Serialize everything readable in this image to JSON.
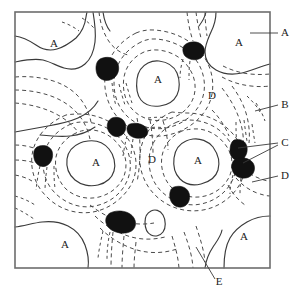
{
  "figure": {
    "kind": "contour-microstructure-diagram",
    "width": 296,
    "height": 294,
    "background_color": "#ffffff",
    "frame": {
      "x": 15,
      "y": 12,
      "width": 255,
      "height": 256,
      "stroke_color": "#6d6d6d"
    },
    "colors": {
      "solid_contour": "#3a3a3a",
      "dashed_contour": "#4a4a4a",
      "grain_fill": "#111111",
      "leader": "#3a3a3a",
      "label_text": "#222222"
    }
  },
  "interior_labels": [
    {
      "id": "a-top-left",
      "text": "A",
      "x": 54,
      "y": 47
    },
    {
      "id": "a-top-center",
      "text": "A",
      "x": 158,
      "y": 83
    },
    {
      "id": "a-top-right",
      "text": "A",
      "x": 239,
      "y": 46
    },
    {
      "id": "d-upper-right",
      "text": "D",
      "x": 212,
      "y": 99
    },
    {
      "id": "a-mid-left",
      "text": "A",
      "x": 96,
      "y": 166
    },
    {
      "id": "d-center",
      "text": "D",
      "x": 152,
      "y": 163
    },
    {
      "id": "a-mid-right",
      "text": "A",
      "x": 198,
      "y": 164
    },
    {
      "id": "a-bottom-left",
      "text": "A",
      "x": 65,
      "y": 248
    },
    {
      "id": "a-bottom-right",
      "text": "A",
      "x": 244,
      "y": 240
    }
  ],
  "callout_labels": [
    {
      "id": "callout-a",
      "text": "A",
      "x": 285,
      "y": 36
    },
    {
      "id": "callout-b",
      "text": "B",
      "x": 285,
      "y": 108
    },
    {
      "id": "callout-c",
      "text": "C",
      "x": 285,
      "y": 146
    },
    {
      "id": "callout-d",
      "text": "D",
      "x": 285,
      "y": 179
    },
    {
      "id": "callout-e",
      "text": "E",
      "x": 219,
      "y": 285
    }
  ],
  "leader_lines": [
    {
      "id": "leader-a",
      "points": "250,33 278,33"
    },
    {
      "id": "leader-b",
      "points": "255,111 278,105"
    },
    {
      "id": "leader-c-upper",
      "points": "238,148 278,143"
    },
    {
      "id": "leader-c-lower",
      "points": "243,163 278,145"
    },
    {
      "id": "leader-d",
      "points": "252,182 278,176"
    },
    {
      "id": "leader-e",
      "points": "196,247 215,279"
    }
  ],
  "grains": [
    {
      "id": "grain-top-center-right",
      "cx": 194,
      "cy": 50
    },
    {
      "id": "grain-upper-left",
      "cx": 106,
      "cy": 70
    },
    {
      "id": "grain-center-upper-a",
      "cx": 117,
      "cy": 126
    },
    {
      "id": "grain-center-upper-b",
      "cx": 138,
      "cy": 130
    },
    {
      "id": "grain-left-mid",
      "cx": 43,
      "cy": 155
    },
    {
      "id": "grain-right-upper",
      "cx": 240,
      "cy": 150
    },
    {
      "id": "grain-right-lower",
      "cx": 245,
      "cy": 165
    },
    {
      "id": "grain-center-lower",
      "cx": 180,
      "cy": 196
    },
    {
      "id": "grain-bottom-left",
      "cx": 121,
      "cy": 221
    }
  ]
}
